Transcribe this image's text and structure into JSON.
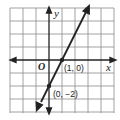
{
  "figure": {
    "type": "coordinate-graph",
    "axes": {
      "x_label": "x",
      "y_label": "y",
      "origin_label": "O"
    },
    "points": [
      {
        "label": "(1, 0)",
        "x": 1,
        "y": 0
      },
      {
        "label": "(0, −2)",
        "x": 0,
        "y": -2
      }
    ],
    "line": {
      "slope": 2,
      "intercept": -2,
      "equation": "y = 2x - 2"
    },
    "grid": {
      "x_range": [
        -3,
        5
      ],
      "y_range": [
        -4,
        4
      ]
    }
  },
  "colors": {
    "grid": "#8a8a8a",
    "axis": "#222222",
    "line": "#222222",
    "background": "#ffffff"
  }
}
